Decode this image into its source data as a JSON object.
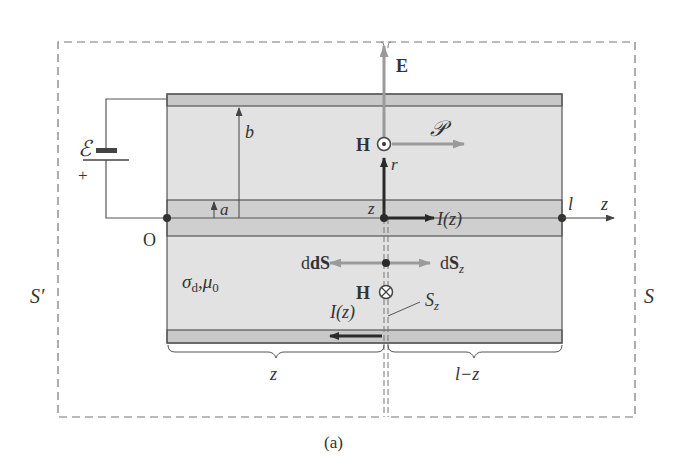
{
  "figure": {
    "caption": "(a)",
    "colors": {
      "conductor": "#c8c8c8",
      "dielectric": "#e2e2e2",
      "line": "#555555",
      "dark_arrow": "#2a2a2a",
      "gray_arrow": "#9a9a9a",
      "dash": "#777777"
    }
  },
  "labels": {
    "emf": "ℰ",
    "plus": "+",
    "b": "b",
    "a": "a",
    "origin": "O",
    "E": "E",
    "H_top": "H",
    "poynting": "𝒫",
    "r": "r",
    "z_point": "z",
    "current_top": "I(z)",
    "l": "l",
    "z_axis": "z",
    "dS": "dS",
    "dSz": "dS",
    "dSz_sub": "z",
    "H_bottom": "H",
    "Sz": "S",
    "Sz_sub": "z",
    "medium_sigma": "σ",
    "medium_sigma_sub": "d",
    "medium_mu": ",μ",
    "medium_mu_sub": "0",
    "current_bottom": "I(z)",
    "brace_left": "z",
    "brace_right": "l−z",
    "surface_left": "S′",
    "surface_right": "S"
  }
}
